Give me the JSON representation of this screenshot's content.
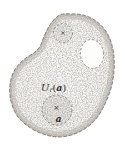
{
  "figure": {
    "labels": {
      "neighborhood_U": "U",
      "neighborhood_sub": "r",
      "paren_open": "(",
      "neighborhood_arg": "a",
      "paren_close": ")",
      "center_point": "a",
      "cross_mark": "×"
    },
    "colors": {
      "paper": "#ffffff",
      "region_tint": "#edebe6",
      "stipple": "#78746d",
      "edge_shade": "#aaa49c",
      "dashed_outline": "#6c675f",
      "inner_dashed": "#746f67",
      "text": "#35312b"
    }
  }
}
